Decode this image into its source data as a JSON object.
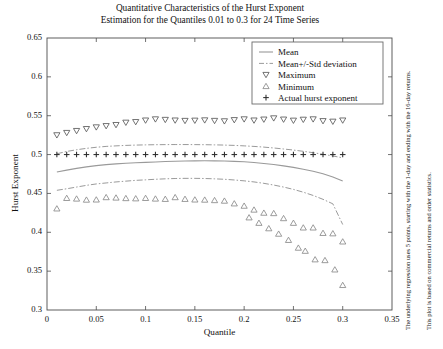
{
  "title": {
    "line1": "Quantitative Characteristics of the Hurst Exponent",
    "line2": "Estimation for the Quantiles 0.01 to 0.3 for 24 Time Series"
  },
  "side_notes": {
    "note1": "The underlying regression uses 5 points, starting with the 1-day and ending with the 16-day returns.",
    "note2": "This plot is based on commercial returns and order statistics."
  },
  "colors": {
    "axis": "#4d4d4d",
    "mean": "#9a9a9a",
    "band": "#8f8f8f",
    "maximum": "#5a5a5a",
    "minimum": "#8a8a8a",
    "actual": "#2b2b2b",
    "legend_border": "#6b6b6b",
    "background": "#ffffff"
  },
  "chart_data": {
    "type": "scatter",
    "xlabel": "Quantile",
    "ylabel": "Hurst Exponent",
    "xlim": [
      0,
      0.35
    ],
    "ylim": [
      0.3,
      0.65
    ],
    "xticks": [
      0,
      0.05,
      0.1,
      0.15,
      0.2,
      0.25,
      0.3,
      0.35
    ],
    "xtick_labels": [
      "0",
      "0.05",
      "0.1",
      "0.15",
      "0.2",
      "0.25",
      "0.3",
      "0.35"
    ],
    "yticks": [
      0.3,
      0.35,
      0.4,
      0.45,
      0.5,
      0.55,
      0.6,
      0.65
    ],
    "ytick_labels": [
      "0.3",
      "0.35",
      "0.4",
      "0.45",
      "0.5",
      "0.55",
      "0.6",
      "0.65"
    ],
    "grid": false,
    "legend_position": "upper right",
    "x": [
      0.01,
      0.02,
      0.03,
      0.04,
      0.05,
      0.06,
      0.07,
      0.08,
      0.09,
      0.1,
      0.11,
      0.12,
      0.13,
      0.14,
      0.15,
      0.16,
      0.17,
      0.18,
      0.19,
      0.2,
      0.21,
      0.22,
      0.23,
      0.24,
      0.25,
      0.26,
      0.27,
      0.28,
      0.29,
      0.3
    ],
    "series": [
      {
        "name": "Mean",
        "style": "line-solid",
        "values": [
          0.4775,
          0.48,
          0.4822,
          0.4842,
          0.4858,
          0.487,
          0.488,
          0.4888,
          0.4895,
          0.49,
          0.4905,
          0.491,
          0.4914,
          0.4917,
          0.4919,
          0.492,
          0.4919,
          0.4917,
          0.4913,
          0.4907,
          0.4898,
          0.4886,
          0.4872,
          0.4855,
          0.4835,
          0.4812,
          0.4785,
          0.4752,
          0.4712,
          0.466
        ]
      },
      {
        "name": "Mean+/-Std deviation",
        "style": "line-dashdot",
        "upper": [
          0.501,
          0.504,
          0.5062,
          0.508,
          0.5094,
          0.5105,
          0.5112,
          0.5118,
          0.5122,
          0.5125,
          0.5127,
          0.5128,
          0.5129,
          0.5129,
          0.5128,
          0.5127,
          0.5125,
          0.5122,
          0.5118,
          0.5112,
          0.5105,
          0.5096,
          0.5085,
          0.5072,
          0.5058,
          0.5042,
          0.5024,
          0.5004,
          0.4982,
          0.4958
        ],
        "lower": [
          0.454,
          0.456,
          0.4582,
          0.4604,
          0.4622,
          0.4635,
          0.4648,
          0.4658,
          0.4668,
          0.4675,
          0.4682,
          0.4688,
          0.4692,
          0.4694,
          0.4694,
          0.4692,
          0.4688,
          0.4682,
          0.4673,
          0.4662,
          0.4648,
          0.463,
          0.4608,
          0.4582,
          0.4552,
          0.4516,
          0.4474,
          0.4424,
          0.4366,
          0.41
        ]
      },
      {
        "name": "Maximum",
        "style": "marker-triangle-down",
        "values": [
          0.525,
          0.528,
          0.5305,
          0.533,
          0.5352,
          0.5368,
          0.5382,
          0.5412,
          0.542,
          0.544,
          0.5455,
          0.5448,
          0.544,
          0.5435,
          0.5438,
          0.5442,
          0.5435,
          0.543,
          0.5445,
          0.5455,
          0.544,
          0.5452,
          0.5468,
          0.5452,
          0.5438,
          0.545,
          0.5455,
          0.5432,
          0.5425,
          0.544
        ]
      },
      {
        "name": "Minimum",
        "style": "marker-triangle-up",
        "values": [
          0.4305,
          0.444,
          0.4432,
          0.4418,
          0.442,
          0.445,
          0.4445,
          0.4438,
          0.4435,
          0.444,
          0.4432,
          0.4428,
          0.445,
          0.4428,
          0.442,
          0.4418,
          0.4412,
          0.4405,
          0.437,
          0.434,
          0.429,
          0.425,
          0.4245,
          0.418,
          0.412,
          0.406,
          0.406,
          0.399,
          0.3985,
          0.388
        ]
      },
      {
        "name": "Actual hurst exponent",
        "style": "marker-plus",
        "values": [
          0.5,
          0.5,
          0.5,
          0.5,
          0.5,
          0.5,
          0.5,
          0.5,
          0.5,
          0.5,
          0.5,
          0.5,
          0.5,
          0.5,
          0.5,
          0.5,
          0.5,
          0.5,
          0.5,
          0.5,
          0.5,
          0.5,
          0.5,
          0.5,
          0.5,
          0.5,
          0.5,
          0.5,
          0.5,
          0.5
        ]
      }
    ],
    "minimum_tail": {
      "note": "minimum markers continue steeply downward in the right region",
      "x": [
        0.205,
        0.215,
        0.225,
        0.235,
        0.245,
        0.255,
        0.262,
        0.272,
        0.282,
        0.292,
        0.3
      ],
      "values": [
        0.419,
        0.412,
        0.405,
        0.398,
        0.39,
        0.38,
        0.376,
        0.365,
        0.364,
        0.352,
        0.332
      ]
    }
  },
  "legend": {
    "items": [
      {
        "label": "Mean",
        "marker": "line-solid"
      },
      {
        "label": "Mean+/-Std deviation",
        "marker": "line-dashdot"
      },
      {
        "label": "Maximum",
        "marker": "triangle-down"
      },
      {
        "label": "Minimum",
        "marker": "triangle-up"
      },
      {
        "label": "Actual hurst exponent",
        "marker": "plus"
      }
    ]
  }
}
